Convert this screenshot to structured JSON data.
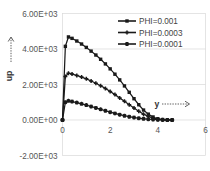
{
  "chart_data": {
    "type": "line",
    "title": "",
    "subtitle": "",
    "xlabel": "y",
    "ylabel": "up",
    "xlim": [
      0,
      6
    ],
    "ylim": [
      -2000,
      6000
    ],
    "x_ticks": [
      "0",
      "2",
      "4",
      "6"
    ],
    "x_tick_values": [
      0,
      2,
      4,
      6
    ],
    "y_ticks": [
      "-2.00E+03",
      "0.00E+00",
      "2.00E+03",
      "4.00E+03",
      "6.00E+03"
    ],
    "y_tick_values": [
      -2000,
      0,
      2000,
      4000,
      6000
    ],
    "grid": true,
    "legend_position": "top-right",
    "series": [
      {
        "name": "PHI=0.001",
        "marker": "square",
        "color": "#1a1a1a",
        "x": [
          0.0,
          0.12,
          0.25,
          0.4,
          0.6,
          0.8,
          1.0,
          1.2,
          1.4,
          1.6,
          1.8,
          2.0,
          2.2,
          2.4,
          2.6,
          2.8,
          3.0,
          3.2,
          3.4,
          3.6,
          3.8,
          4.0,
          4.2,
          4.4,
          4.6
        ],
        "y": [
          0,
          4150,
          4680,
          4600,
          4450,
          4280,
          4090,
          3880,
          3660,
          3420,
          3160,
          2880,
          2580,
          2260,
          1920,
          1560,
          1200,
          860,
          560,
          330,
          170,
          70,
          25,
          8,
          0
        ]
      },
      {
        "name": "PHI=0.0003",
        "marker": "plus",
        "color": "#1a1a1a",
        "x": [
          0.0,
          0.12,
          0.25,
          0.4,
          0.6,
          0.8,
          1.0,
          1.2,
          1.4,
          1.6,
          1.8,
          2.0,
          2.2,
          2.4,
          2.6,
          2.8,
          3.0,
          3.2,
          3.4,
          3.6,
          3.8,
          4.0,
          4.2,
          4.4,
          4.6
        ],
        "y": [
          0,
          2450,
          2640,
          2590,
          2510,
          2420,
          2320,
          2200,
          2070,
          1930,
          1780,
          1610,
          1430,
          1240,
          1050,
          860,
          670,
          490,
          330,
          200,
          105,
          45,
          15,
          5,
          0
        ]
      },
      {
        "name": "PHI=0.0001",
        "marker": "star",
        "color": "#1a1a1a",
        "x": [
          0.0,
          0.12,
          0.25,
          0.4,
          0.6,
          0.8,
          1.0,
          1.2,
          1.4,
          1.6,
          1.8,
          2.0,
          2.2,
          2.4,
          2.6,
          2.8,
          3.0,
          3.2,
          3.4,
          3.6,
          3.8,
          4.0,
          4.2,
          4.4,
          4.6
        ],
        "y": [
          0,
          1000,
          1080,
          1040,
          980,
          910,
          840,
          760,
          680,
          600,
          520,
          440,
          370,
          300,
          240,
          185,
          140,
          100,
          70,
          45,
          28,
          15,
          7,
          2,
          0
        ]
      }
    ]
  },
  "axes": {
    "y_axis_title": "up",
    "x_axis_title": "y"
  },
  "legend": {
    "entries": [
      {
        "label": "PHI=0.001"
      },
      {
        "label": "PHI=0.0003"
      },
      {
        "label": "PHI=0.0001"
      }
    ]
  },
  "icons": {
    "y_arrow": "arrow-up-dotted-icon",
    "x_arrow": "arrow-right-dotted-icon"
  }
}
